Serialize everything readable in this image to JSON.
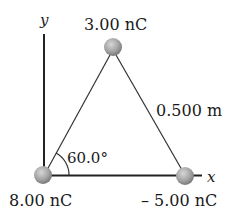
{
  "diagram": {
    "type": "charge-triangle",
    "axes": {
      "x_label": "x",
      "y_label": "y"
    },
    "charges": [
      {
        "id": "top",
        "label": "3.00 nC",
        "value_nC": 3.0
      },
      {
        "id": "bottom-left",
        "label": "8.00 nC",
        "value_nC": 8.0
      },
      {
        "id": "bottom-right",
        "label": "– 5.00 nC",
        "value_nC": -5.0
      }
    ],
    "side_length_label": "0.500 m",
    "angle_label": "60.0°",
    "colors": {
      "line": "#2a2a2a",
      "sphere_light": "#c8c8c8",
      "sphere_dark": "#7e7e7e",
      "text": "#1a1a1a"
    }
  }
}
